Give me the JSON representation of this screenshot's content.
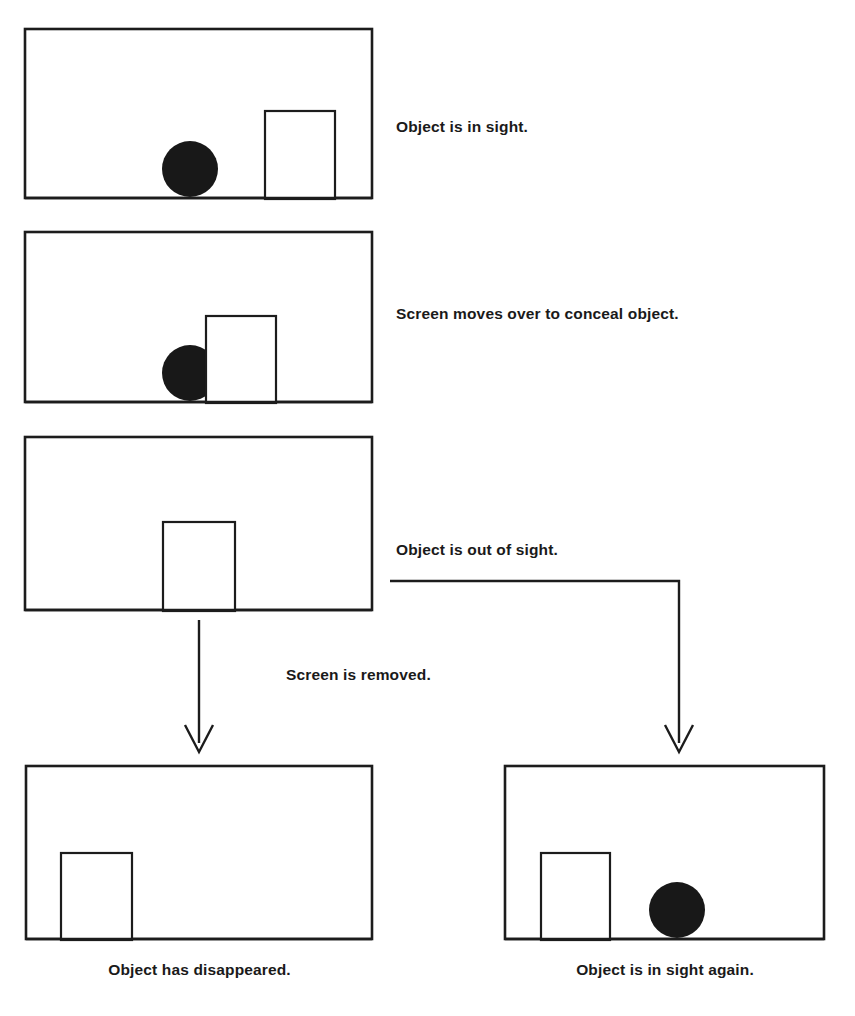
{
  "document": {
    "title": "Object permanence sequence",
    "background_color": "#ffffff",
    "ink_color": "#1c1c1c"
  },
  "panels": [
    {
      "id": "panel-1",
      "order": 1,
      "name": "object-in-sight-panel",
      "frame": {
        "x": 25,
        "y": 29,
        "width": 347,
        "height": 169
      },
      "screen": {
        "x": 265,
        "y": 111,
        "width": 70,
        "height": 87,
        "visible": true
      },
      "object": {
        "shape": "circle",
        "cx": 190,
        "cy": 169,
        "r": 28,
        "color": "#181818",
        "visible": true,
        "occluded": false
      },
      "label": "Object is in sight."
    },
    {
      "id": "panel-2",
      "order": 2,
      "name": "screen-conceals-object-panel",
      "frame": {
        "x": 25,
        "y": 232,
        "width": 347,
        "height": 170
      },
      "screen": {
        "x": 206,
        "y": 315,
        "width": 70,
        "height": 87,
        "visible": true
      },
      "object": {
        "shape": "circle",
        "cx": 190,
        "cy": 372,
        "r": 28,
        "color": "#181818",
        "visible": true,
        "occluded": true
      },
      "label": "Screen moves over to conceal object."
    },
    {
      "id": "panel-3",
      "order": 3,
      "name": "object-out-of-sight-panel",
      "frame": {
        "x": 25,
        "y": 437,
        "width": 347,
        "height": 173
      },
      "screen": {
        "x": 163,
        "y": 522,
        "width": 72,
        "height": 88,
        "visible": true
      },
      "object": {
        "shape": "circle",
        "cx": 199,
        "cy": 580,
        "r": 28,
        "color": "#181818",
        "visible": false,
        "occluded": true
      },
      "label": "Object is out of sight."
    },
    {
      "id": "panel-4",
      "order": 4,
      "name": "object-disappeared-panel",
      "frame": {
        "x": 26,
        "y": 766,
        "width": 346,
        "height": 173
      },
      "screen": {
        "x": 61,
        "y": 853,
        "width": 71,
        "height": 86,
        "visible": true
      },
      "object": {
        "shape": "circle",
        "cx": 0,
        "cy": 0,
        "r": 0,
        "color": "#181818",
        "visible": false,
        "occluded": false
      },
      "label": "Object has disappeared."
    },
    {
      "id": "panel-5",
      "order": 5,
      "name": "object-in-sight-again-panel",
      "frame": {
        "x": 505,
        "y": 766,
        "width": 319,
        "height": 173
      },
      "screen": {
        "x": 541,
        "y": 853,
        "width": 69,
        "height": 86,
        "visible": true
      },
      "object": {
        "shape": "circle",
        "cx": 677,
        "cy": 909,
        "r": 28,
        "color": "#181818",
        "visible": true,
        "occluded": false
      },
      "label": "Object is in sight again."
    }
  ],
  "labels": {
    "in_sight": "Object is in sight.",
    "conceal": "Screen moves over to conceal object.",
    "out_of_sight": "Object is out of sight.",
    "screen_removed": "Screen is removed.",
    "disappeared": "Object has disappeared.",
    "in_sight_again": "Object is in sight again."
  },
  "connectors": [
    {
      "id": "connector-left",
      "name": "screen-removed-arrow",
      "from_panel": "panel-3",
      "to_panel": "panel-4",
      "kind": "straight-down-arrow",
      "path": "M199,620 L199,742",
      "arrow_head": "M185,726 L199,751 L213,726",
      "label": "Screen is removed."
    },
    {
      "id": "connector-right",
      "name": "out-of-sight-elbow-arrow",
      "from_panel": "panel-3",
      "to_panel": "panel-5",
      "kind": "elbow-down-arrow",
      "path": "M390,581 L679,581 L679,742",
      "arrow_head": "M665,726 L679,751 L693,726",
      "label": "Object is out of sight."
    }
  ]
}
